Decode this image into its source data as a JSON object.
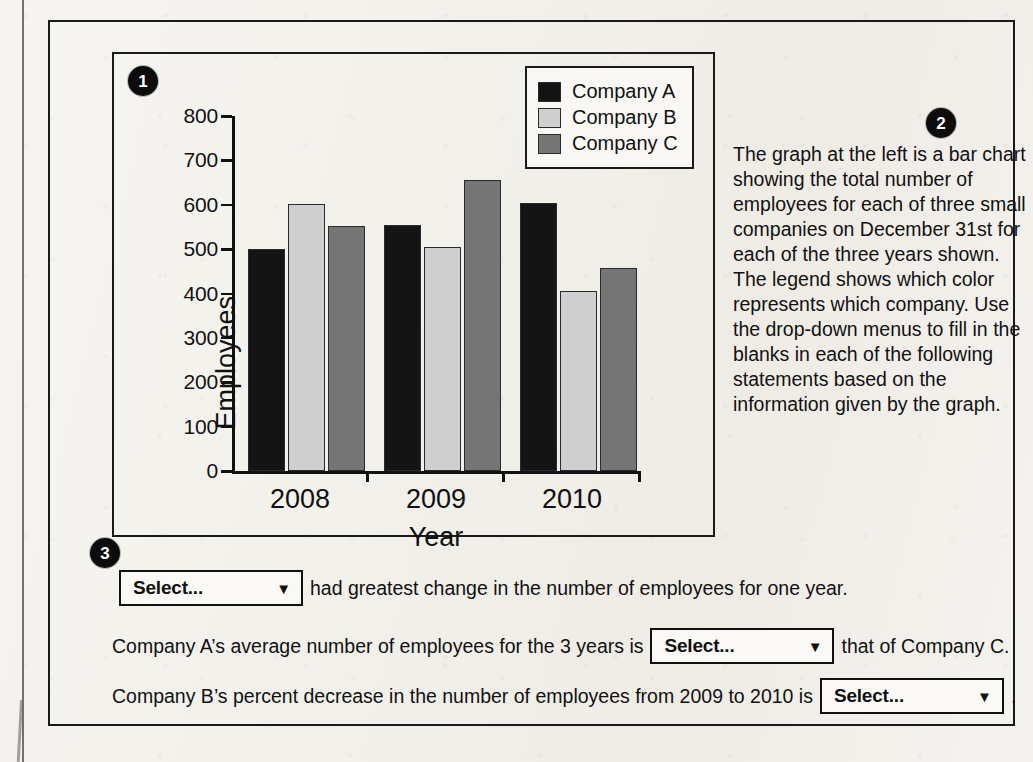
{
  "badges": {
    "one": "1",
    "two": "2",
    "three": "3"
  },
  "chart_data": {
    "type": "bar",
    "title": "",
    "xlabel": "Year",
    "ylabel": "Employees",
    "categories": [
      "2008",
      "2009",
      "2010"
    ],
    "ylim": [
      0,
      800
    ],
    "yticks": [
      0,
      100,
      200,
      300,
      400,
      500,
      600,
      700,
      800
    ],
    "ytick_labels": [
      "0",
      "100",
      "200",
      "300",
      "400",
      "500",
      "600",
      "700",
      "800"
    ],
    "grid": false,
    "legend_position": "top-right",
    "series": [
      {
        "name": "Company A",
        "color": "#141414",
        "values": [
          500,
          554,
          605
        ]
      },
      {
        "name": "Company B",
        "color": "#cfcfcf",
        "values": [
          602,
          504,
          405
        ]
      },
      {
        "name": "Company C",
        "color": "#757575",
        "values": [
          552,
          655,
          458
        ]
      }
    ]
  },
  "legend": {
    "entries": [
      {
        "label": "Company A",
        "color": "#141414"
      },
      {
        "label": "Company B",
        "color": "#cfcfcf"
      },
      {
        "label": "Company C",
        "color": "#757575"
      }
    ]
  },
  "description": {
    "text": "The graph at the left is a bar chart showing the total number of employees for each of three small companies on December 31st for each of the three years shown. The legend shows which color represents which company. Use the drop-down menus to fill in the blanks in each of the following statements based on the information given by the graph."
  },
  "statements": {
    "dropdown_placeholder": "Select...",
    "caret_icon": "▼",
    "items": [
      {
        "before": "",
        "after": "had greatest change in the number of employees for one year."
      },
      {
        "before": "Company A’s average number of employees for the 3 years is",
        "after": "that of Company C."
      },
      {
        "before": "Company B’s percent decrease in the number of employees from 2009 to 2010 is",
        "after": "."
      }
    ]
  }
}
